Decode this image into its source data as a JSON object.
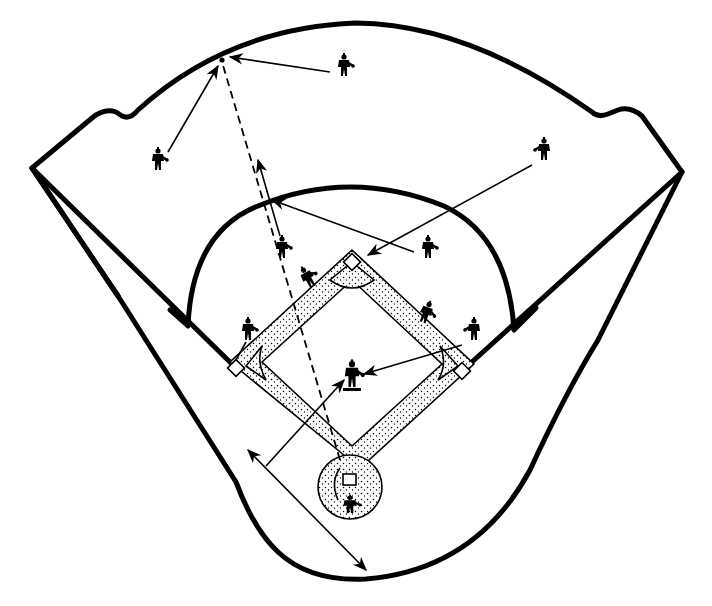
{
  "diagram": {
    "title": "Baseball field defensive play diagram",
    "colors": {
      "line": "#000000",
      "background": "#ffffff"
    },
    "field": {
      "home_plate": {
        "x": 350,
        "y": 480
      },
      "first_base": {
        "x": 462,
        "y": 371
      },
      "second_base": {
        "x": 352,
        "y": 262
      },
      "third_base": {
        "x": 236,
        "y": 368
      },
      "pitcher": {
        "x": 352,
        "y": 375
      }
    },
    "players": [
      {
        "id": "left-fielder",
        "x": 158,
        "y": 160
      },
      {
        "id": "center-fielder",
        "x": 344,
        "y": 66
      },
      {
        "id": "right-fielder",
        "x": 544,
        "y": 150
      },
      {
        "id": "shortstop",
        "x": 282,
        "y": 248
      },
      {
        "id": "second-baseman",
        "x": 428,
        "y": 248
      },
      {
        "id": "third-base-coach-runner",
        "x": 308,
        "y": 278
      },
      {
        "id": "runner-near-first",
        "x": 426,
        "y": 313
      },
      {
        "id": "first-baseman",
        "x": 474,
        "y": 330
      },
      {
        "id": "third-baseman",
        "x": 248,
        "y": 330
      },
      {
        "id": "pitcher",
        "x": 352,
        "y": 375
      },
      {
        "id": "catcher",
        "x": 350,
        "y": 505
      }
    ],
    "ball_landing_point": {
      "x": 222,
      "y": 60
    },
    "arrows": [
      {
        "id": "center-fielder-to-ball",
        "from": [
          330,
          72
        ],
        "to": [
          230,
          57
        ],
        "style": "solid"
      },
      {
        "id": "left-fielder-to-ball",
        "from": [
          168,
          152
        ],
        "to": [
          218,
          66
        ],
        "style": "solid"
      },
      {
        "id": "ball-path-from-home",
        "from": [
          340,
          458
        ],
        "to": [
          222,
          62
        ],
        "style": "dashed"
      },
      {
        "id": "shortstop-relay",
        "from": [
          282,
          236
        ],
        "to": [
          258,
          158
        ],
        "style": "solid"
      },
      {
        "id": "second-baseman-to-relay",
        "from": [
          414,
          252
        ],
        "to": [
          272,
          200
        ],
        "style": "solid"
      },
      {
        "id": "right-fielder-throw",
        "from": [
          532,
          165
        ],
        "to": [
          368,
          255
        ],
        "style": "solid"
      },
      {
        "id": "first-baseman-to-pitcher",
        "from": [
          462,
          345
        ],
        "to": [
          362,
          374
        ],
        "style": "solid"
      },
      {
        "id": "cutoff-line",
        "from": [
          266,
          470
        ],
        "to": [
          346,
          380
        ],
        "style": "solid"
      },
      {
        "id": "third-baseman-to-bag",
        "from": [
          246,
          342
        ],
        "to": [
          234,
          362
        ],
        "style": "solid"
      },
      {
        "id": "distance-measure",
        "from": [
          247,
          449
        ],
        "to": [
          368,
          572
        ],
        "style": "double-arrow"
      }
    ],
    "labels": {
      "mound_note": "illegible small text under pitcher"
    }
  }
}
